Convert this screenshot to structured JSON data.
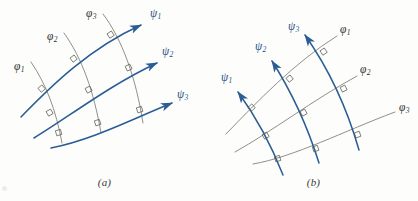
{
  "figure": {
    "background_color": "#fdfdfb",
    "curve_color_phi": "#7c7c74",
    "curve_color_psi": "#2a5c96",
    "label_color_phi": "#2e2e2c",
    "label_color_psi": "#1f4f86",
    "right_angle_marker_color": "#5a5a54"
  },
  "panels": [
    {
      "id": "a",
      "caption": "(a)",
      "description": "Orthogonal families of curves: three gray phi curves crossing three blue psi curves with arrowheads pointing right",
      "phi_labels": [
        {
          "text": "φ",
          "sub": "1",
          "x": 14,
          "y": 61
        },
        {
          "text": "φ",
          "sub": "2",
          "x": 47,
          "y": 31
        },
        {
          "text": "φ",
          "sub": "3",
          "x": 86,
          "y": 8
        }
      ],
      "psi_labels": [
        {
          "text": "ψ",
          "sub": "1",
          "x": 150,
          "y": 8
        },
        {
          "text": "ψ",
          "sub": "2",
          "x": 162,
          "y": 46
        },
        {
          "text": "ψ",
          "sub": "3",
          "x": 177,
          "y": 89
        }
      ]
    },
    {
      "id": "b",
      "caption": "(b)",
      "description": "Same orthogonal net with roles exchanged: gray phi curves labelled at right, blue psi curves with arrowheads pointing up-left",
      "phi_labels": [
        {
          "text": "φ",
          "sub": "1",
          "x": 131,
          "y": 24
        },
        {
          "text": "φ",
          "sub": "2",
          "x": 151,
          "y": 64
        },
        {
          "text": "φ",
          "sub": "3",
          "x": 190,
          "y": 102
        }
      ],
      "psi_labels": [
        {
          "text": "ψ",
          "sub": "1",
          "x": 12,
          "y": 72
        },
        {
          "text": "ψ",
          "sub": "2",
          "x": 46,
          "y": 41
        },
        {
          "text": "ψ",
          "sub": "3",
          "x": 79,
          "y": 21
        }
      ]
    }
  ]
}
